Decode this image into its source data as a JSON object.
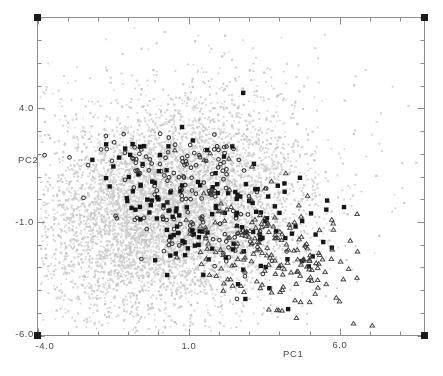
{
  "figure": {
    "background": "#fefefe",
    "width": 443,
    "height": 376
  },
  "labels": {
    "x_title": "PC1",
    "y_title": "PC2",
    "x_tick_neg4": "-4.0",
    "x_tick_1": "1.0",
    "x_tick_6": "6.0",
    "y_tick_4": "4.0",
    "y_tick_neg1": "-1.0",
    "y_tick_neg6": "-6.0"
  },
  "chart_data": {
    "type": "scatter",
    "title": "",
    "xlabel": "PC1",
    "ylabel": "PC2",
    "xlim": [
      -4.0,
      8.8
    ],
    "ylim": [
      -6.0,
      8.0
    ],
    "grid": false,
    "legend": "none",
    "x_ticks": {
      "step": 1,
      "major": [
        -4,
        1,
        6
      ],
      "labels": {
        "-4": "-4.0",
        "1": "1.0",
        "6": "6.0"
      }
    },
    "y_ticks": {
      "step": 1,
      "major": [
        -6,
        -1,
        4
      ],
      "labels": {
        "-6": "-6.0",
        "-1": "-1.0",
        "4": "4.0"
      }
    },
    "frame": {
      "color": "#8c8c8c",
      "corner_marker": "filled-square",
      "corner_color": "#1b1b1b",
      "corner_size": 7,
      "minor_tick_len": 4,
      "major_tick_len": 7
    },
    "seed": 1234,
    "series": [
      {
        "name": "background-population",
        "marker": "dot",
        "size": 1.9,
        "alpha": 0.85,
        "colors": [
          "#d5d5d5",
          "#cacaca",
          "#c0c0c0",
          "#cfcfcf"
        ],
        "clusters": [
          {
            "cx": 0.3,
            "cy": -0.4,
            "sx": 2.1,
            "sy": 2.2,
            "rho": 0.15,
            "n": 5600
          },
          {
            "cx": 0.8,
            "cy": 0.2,
            "sx": 3.1,
            "sy": 3.0,
            "rho": 0.1,
            "n": 950
          }
        ]
      },
      {
        "name": "open-circles",
        "marker": "open-circle",
        "size": 3.6,
        "alpha": 1,
        "colors": [
          "#2e2e2e"
        ],
        "clusters": [
          {
            "cx": 0.6,
            "cy": 1.6,
            "sx": 1.4,
            "sy": 0.8,
            "rho": -0.5,
            "n": 85
          },
          {
            "cx": 1.6,
            "cy": -1.3,
            "sx": 1.5,
            "sy": 1.0,
            "rho": -0.55,
            "n": 85
          }
        ]
      },
      {
        "name": "filled-squares",
        "marker": "filled-square",
        "size": 4.4,
        "alpha": 1,
        "colors": [
          "#161616"
        ],
        "clusters": [
          {
            "cx": 0.6,
            "cy": -0.8,
            "sx": 1.2,
            "sy": 1.7,
            "rho": -0.75,
            "n": 70
          },
          {
            "cx": 2.7,
            "cy": -0.3,
            "sx": 1.7,
            "sy": 1.5,
            "rho": -0.3,
            "n": 78
          }
        ]
      },
      {
        "name": "open-triangles",
        "marker": "open-triangle",
        "size": 4.6,
        "alpha": 1,
        "colors": [
          "#3c3c3c"
        ],
        "clusters": [
          {
            "cx": 3.6,
            "cy": -2.2,
            "sx": 1.3,
            "sy": 1.3,
            "rho": -0.35,
            "n": 178
          },
          {
            "cx": 2.4,
            "cy": 0.4,
            "sx": 1.4,
            "sy": 0.9,
            "rho": -0.3,
            "n": 14
          }
        ]
      }
    ]
  }
}
